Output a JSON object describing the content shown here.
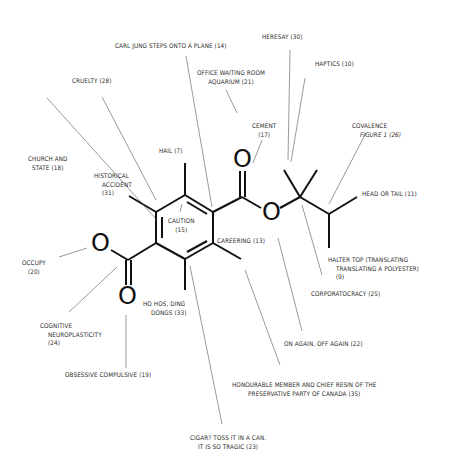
{
  "diagram": {
    "type": "annotated-molecule",
    "atoms": {
      "oxygen_symbol": "O"
    },
    "labels": {
      "carl_jung": "CARL JUNG STEPS ONTO A PLANE (14)",
      "heresay": "HERESAY (30)",
      "office_line1": "OFFICE WAITING ROOM",
      "office_line2": "AQUARIUM (21)",
      "haptics": "HAPTICS (10)",
      "cruelty": "CRUELTY (28)",
      "cement_line1": "CEMENT",
      "cement_line2": "(17)",
      "covalence_line1": "COVALENCE",
      "covalence_line2": "FIGURE 1 (26)",
      "hail": "HAIL (7)",
      "church_line1": "CHURCH AND",
      "church_line2": "STATE (18)",
      "historical_line1": "HISTORICAL",
      "historical_line2": "ACCIDENT",
      "historical_line3": "(31)",
      "head_or_tail": "HEAD OR TAIL (11)",
      "caution_line1": "CAUTION",
      "caution_line2": "(15)",
      "careering": "CAREERING (13)",
      "occupy_line1": "OCCUPY",
      "occupy_line2": "(20)",
      "halter_line1": "HALTER TOP (TRANSLATING",
      "halter_line2": "TRANSLATING A POLYESTER)",
      "halter_line3": "(9)",
      "corporatocracy": "CORPORATOCRACY (25)",
      "hohos_line1": "HO HOS, DING",
      "hohos_line2": "DONGS (33)",
      "cognitive_line1": "COGNITIVE",
      "cognitive_line2": "NEUROPLASTICITY",
      "cognitive_line3": "(24)",
      "obsessive": "OBSESSIVE COMPULSIVE (19)",
      "on_again": "ON AGAIN, OFF AGAIN (22)",
      "honourable_line1": "HONOURABLE MEMBER AND CHIEF RESIN OF THE",
      "honourable_line2": "PRESERVATIVE PARTY OF CANADA (35)",
      "cigar_line1": "CIGAR? TOSS IT IN A CAN.",
      "cigar_line2": "IT IS SO TRAGIC (23)"
    },
    "colors": {
      "bond": "#111111",
      "leader": "#555555",
      "text": "#2a2a2a",
      "background": "#ffffff"
    }
  }
}
